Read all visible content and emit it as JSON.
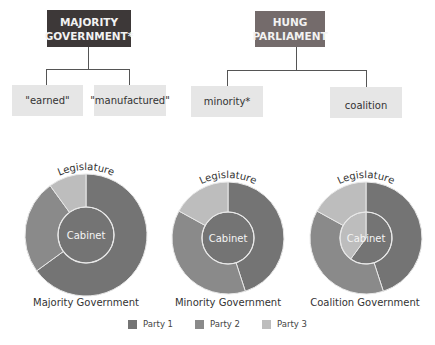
{
  "org_chart": {
    "majority": {
      "title_line1": "MAJORITY",
      "title_line2": "GOVERNMENT*",
      "color": "#3d3838",
      "children": [
        "\"earned\"",
        "\"manufactured\""
      ]
    },
    "hung": {
      "title_line1": "HUNG",
      "title_line2": "PARLIAMENT",
      "color": "#746b6b",
      "children": [
        "minority*",
        "coalition"
      ]
    }
  },
  "colors": {
    "party1": "#747474",
    "party2": "#8a8a8a",
    "party3": "#bdbdbd",
    "divider": "#e8e8e8"
  },
  "chart_data": {
    "type": "pie",
    "outer_label": "Legislature",
    "inner_label": "Cabinet",
    "legend": [
      "Party 1",
      "Party 2",
      "Party 3"
    ],
    "legend_placement": "bottom",
    "charts": [
      {
        "name": "Majority Government",
        "legislature": [
          {
            "party": "Party 1",
            "share": 0.65
          },
          {
            "party": "Party 2",
            "share": 0.25
          },
          {
            "party": "Party 3",
            "share": 0.1
          }
        ],
        "cabinet": [
          {
            "party": "Party 1",
            "share": 1.0
          }
        ]
      },
      {
        "name": "Minority Government",
        "legislature": [
          {
            "party": "Party 1",
            "share": 0.45
          },
          {
            "party": "Party 2",
            "share": 0.38
          },
          {
            "party": "Party 3",
            "share": 0.17
          }
        ],
        "cabinet": [
          {
            "party": "Party 1",
            "share": 1.0
          }
        ]
      },
      {
        "name": "Coalition Government",
        "legislature": [
          {
            "party": "Party 1",
            "share": 0.45
          },
          {
            "party": "Party 2",
            "share": 0.38
          },
          {
            "party": "Party 3",
            "share": 0.17
          }
        ],
        "cabinet": [
          {
            "party": "Party 1",
            "share": 0.6
          },
          {
            "party": "Party 3",
            "share": 0.4
          }
        ]
      }
    ]
  }
}
